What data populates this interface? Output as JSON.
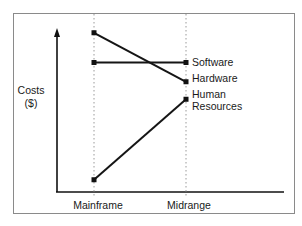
{
  "chart_data": {
    "type": "line",
    "title": "",
    "xlabel": "",
    "ylabel": "Costs ($)",
    "ylabel_lines": [
      "Costs",
      "($)"
    ],
    "categories": [
      "Mainframe",
      "Midrange"
    ],
    "series": [
      {
        "name": "Hardware",
        "values": [
          0.91,
          0.63
        ]
      },
      {
        "name": "Software",
        "values": [
          0.74,
          0.74
        ]
      },
      {
        "name": "Human Resources",
        "values": [
          0.07,
          0.53
        ]
      }
    ],
    "series_labels": {
      "Software": [
        "Software"
      ],
      "Hardware": [
        "Hardware"
      ],
      "Human Resources": [
        "Human",
        "Resources"
      ]
    },
    "ylim": [
      0,
      1
    ],
    "y_ticks": [],
    "grid": false,
    "legend": "none (series labels placed at right end of lines)",
    "colors": {
      "line": "#151515",
      "frame": "#8a8a8a",
      "guide": "#9a9a9a"
    }
  }
}
